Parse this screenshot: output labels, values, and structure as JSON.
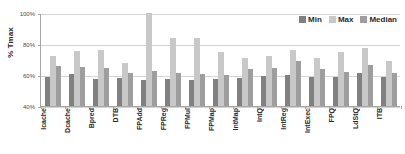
{
  "chart_data": {
    "type": "bar",
    "title": "",
    "subtitle": "",
    "xlabel": "",
    "ylabel": "% Tmax",
    "ylim": [
      40,
      100
    ],
    "yticks": [
      "40%",
      "60%",
      "80%",
      "100%"
    ],
    "ytick_values": [
      40,
      60,
      80,
      100
    ],
    "grid": true,
    "legend_position": "top-right",
    "categories": [
      "Icache",
      "Dcache",
      "Bpred",
      "DTB",
      "FPAdd",
      "FPReg",
      "FPMul",
      "FPMap",
      "IntMap",
      "IntQ",
      "IntReg",
      "IntExec",
      "FPQ",
      "LdStQ",
      "ITB"
    ],
    "series": [
      {
        "name": "Min",
        "color": "#808080",
        "values": [
          58.8,
          60.5,
          57.5,
          58.2,
          57.1,
          57.5,
          56.8,
          57.5,
          58.2,
          59.2,
          60.2,
          59.0,
          58.6,
          61.0,
          58.5
        ]
      },
      {
        "name": "Max",
        "color": "#c8c8c8",
        "values": [
          72.5,
          75.5,
          76.0,
          67.5,
          100.0,
          84.0,
          84.0,
          74.8,
          71.2,
          72.5,
          76.2,
          71.0,
          74.8,
          77.5,
          68.8
        ]
      },
      {
        "name": "Median",
        "color": "#9e9e9e",
        "values": [
          66.0,
          65.2,
          64.8,
          61.5,
          62.3,
          61.2,
          60.6,
          60.2,
          63.8,
          64.3,
          69.2,
          64.0,
          62.0,
          66.3,
          61.5
        ]
      }
    ]
  },
  "legend": {
    "items": [
      {
        "label": "Min",
        "color": "#808080"
      },
      {
        "label": "Max",
        "color": "#c8c8c8"
      },
      {
        "label": "Median",
        "color": "#9e9e9e"
      }
    ]
  },
  "axis": {
    "y_title": "% Tmax"
  }
}
